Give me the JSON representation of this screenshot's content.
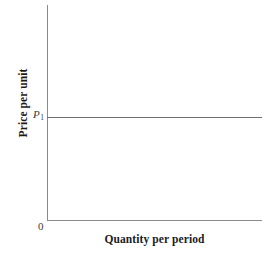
{
  "chart_data": {
    "type": "line",
    "title": "",
    "subtitle": "",
    "xlabel": "Quantity per period",
    "ylabel": "Price per unit",
    "origin_label": "0",
    "grid": false,
    "legend": "none",
    "xlim": [
      0,
      100
    ],
    "ylim": [
      0,
      100
    ],
    "xticks": [],
    "yticks": [],
    "annotations": [
      {
        "name": "price-level-label",
        "text": "P",
        "subscript": "1",
        "value": 48,
        "axis": "y"
      }
    ],
    "series": [
      {
        "name": "perfectly-elastic-demand",
        "type": "line",
        "color": "#6e6e6e",
        "x": [
          0,
          100
        ],
        "values": [
          48,
          48
        ],
        "label": ""
      }
    ]
  },
  "figure": {
    "axes": {
      "y_axis_label": "Price per unit",
      "x_axis_label": "Quantity per period",
      "origin": "0",
      "axis_color": "#8a8a8a"
    },
    "price_line": {
      "label_text": "P",
      "label_subscript": "1",
      "color": "#6e6e6e"
    },
    "background_color": "#ffffff"
  }
}
